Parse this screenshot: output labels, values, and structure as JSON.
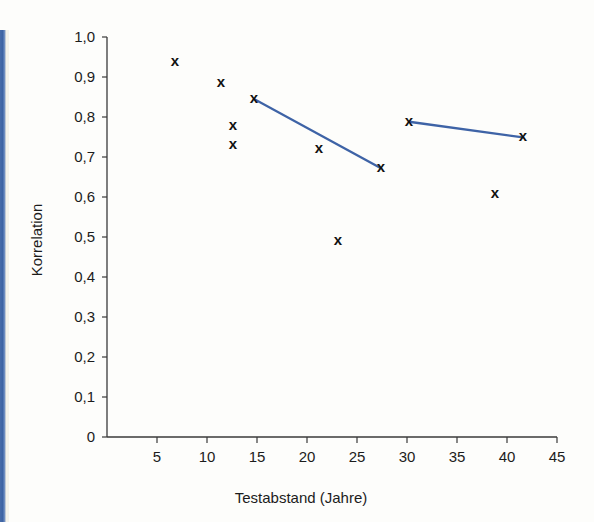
{
  "figure": {
    "background_color": "#fdfdfb",
    "edge_bar_color": "#3d63a3"
  },
  "chart_data": {
    "type": "scatter",
    "title": "",
    "subtitle": "",
    "xlabel": "Testabstand (Jahre)",
    "ylabel": "Korrelation",
    "xlim": [
      0,
      45
    ],
    "ylim": [
      0,
      1.0
    ],
    "xticks": [
      5,
      10,
      15,
      20,
      25,
      30,
      35,
      40,
      45
    ],
    "xtick_labels": [
      "5",
      "10",
      "15",
      "20",
      "25",
      "30",
      "35",
      "40",
      "45"
    ],
    "yticks": [
      0,
      0.1,
      0.2,
      0.3,
      0.4,
      0.5,
      0.6,
      0.7,
      0.8,
      0.9,
      1.0
    ],
    "ytick_labels": [
      "0",
      "0,1",
      "0,2",
      "0,3",
      "0,4",
      "0,5",
      "0,6",
      "0,7",
      "0,8",
      "0,9",
      "1,0"
    ],
    "grid": false,
    "legend": null,
    "marker_symbol": "x",
    "marker_color": "#111111",
    "points": [
      {
        "x": 6.8,
        "y": 0.938
      },
      {
        "x": 11.4,
        "y": 0.884
      },
      {
        "x": 14.7,
        "y": 0.845
      },
      {
        "x": 12.6,
        "y": 0.777
      },
      {
        "x": 12.6,
        "y": 0.729
      },
      {
        "x": 21.2,
        "y": 0.719
      },
      {
        "x": 27.4,
        "y": 0.672
      },
      {
        "x": 23.1,
        "y": 0.489
      },
      {
        "x": 30.2,
        "y": 0.788
      },
      {
        "x": 41.6,
        "y": 0.749
      },
      {
        "x": 38.8,
        "y": 0.608
      }
    ],
    "series": [
      {
        "name": "trend-line-1",
        "type": "line",
        "color": "#3e63a6",
        "points": [
          {
            "x": 14.7,
            "y": 0.845
          },
          {
            "x": 27.4,
            "y": 0.672
          }
        ]
      },
      {
        "name": "trend-line-2",
        "type": "line",
        "color": "#3e63a6",
        "points": [
          {
            "x": 30.2,
            "y": 0.788
          },
          {
            "x": 41.6,
            "y": 0.749
          }
        ]
      }
    ]
  }
}
